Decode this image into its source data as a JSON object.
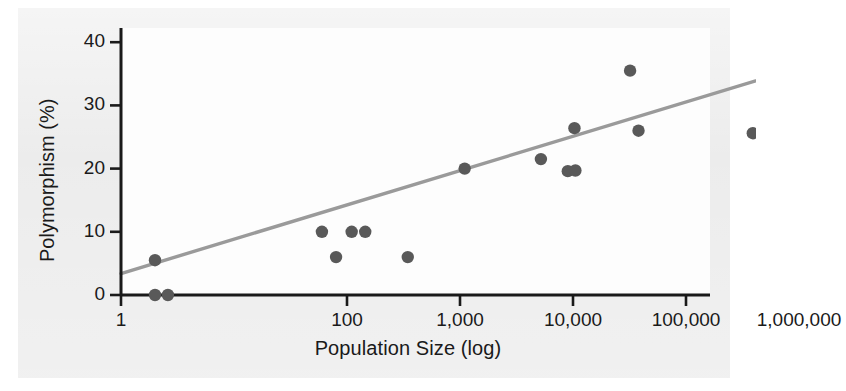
{
  "chart_data": {
    "type": "scatter",
    "title": "",
    "xlabel": "Population Size (log)",
    "ylabel": "Polymorphism (%)",
    "xscale": "log",
    "xlim": [
      1,
      3000000
    ],
    "ylim": [
      0,
      43
    ],
    "xticks": [
      1,
      100,
      1000,
      10000,
      100000,
      1000000
    ],
    "xticklabels": [
      "1",
      "100",
      "1,000",
      "10,000",
      "100,000",
      "1,000,000"
    ],
    "yticks": [
      0,
      10,
      20,
      30,
      40
    ],
    "yticklabels": [
      "0",
      "10",
      "20",
      "30",
      "40"
    ],
    "grid": false,
    "legend": null,
    "marker_color": "#595959",
    "trendline_color": "#9a9a9a",
    "axis_color": "#1a1a1a",
    "panel_color": "#e9e9e9",
    "plot_color": "#fdfdfd",
    "points": [
      {
        "x": 2,
        "y": 5.5
      },
      {
        "x": 2,
        "y": 0.0
      },
      {
        "x": 2.6,
        "y": 0.0
      },
      {
        "x": 60,
        "y": 10.0
      },
      {
        "x": 80,
        "y": 6.0
      },
      {
        "x": 110,
        "y": 10.0
      },
      {
        "x": 145,
        "y": 10.0
      },
      {
        "x": 345,
        "y": 6.0
      },
      {
        "x": 1100,
        "y": 20.0
      },
      {
        "x": 5200,
        "y": 21.5
      },
      {
        "x": 9000,
        "y": 19.6
      },
      {
        "x": 10500,
        "y": 19.7
      },
      {
        "x": 10300,
        "y": 26.4
      },
      {
        "x": 32000,
        "y": 35.5
      },
      {
        "x": 38000,
        "y": 26.0
      },
      {
        "x": 390000,
        "y": 25.6
      }
    ],
    "trendline": {
      "x0": 1,
      "y0": 3.4,
      "x1": 2000000,
      "y1": 37.6
    }
  }
}
